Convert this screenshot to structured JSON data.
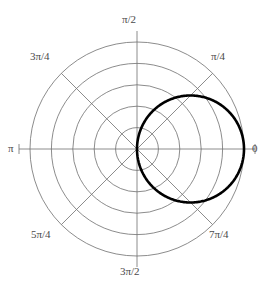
{
  "figure": {
    "kind": "polar-plot",
    "background_color": "#ffffff",
    "grid_color": "#6e6e6e",
    "curve_color": "#000000",
    "label_color": "#4a4a4a"
  },
  "axis_labels": {
    "theta_0": "0",
    "theta_45": "π/4",
    "theta_90": "π/2",
    "theta_135": "3π/4",
    "theta_180": "π",
    "theta_225": "5π/4",
    "theta_270": "3π/2",
    "theta_315": "7π/4"
  },
  "chart_data": {
    "type": "line",
    "projection": "polar",
    "title": "",
    "xlabel": "",
    "ylabel": "",
    "grid": true,
    "legend": null,
    "theta_unit": "radians",
    "theta_tick_labels": [
      "0",
      "π/4",
      "π/2",
      "3π/4",
      "π",
      "5π/4",
      "3π/2",
      "7π/4"
    ],
    "theta_tick_values": [
      0,
      0.7853981634,
      1.5707963268,
      2.3561944902,
      3.1415926536,
      3.926990817,
      4.7123889804,
      5.4977871438
    ],
    "theta_direction": "counterclockwise",
    "theta_zero_location": "E",
    "r_rings": 5,
    "rlim": [
      0,
      5
    ],
    "r_tick_values": [
      1,
      2,
      3,
      4,
      5
    ],
    "r_tick_labels_visible": false,
    "series": [
      {
        "name": "r = 5 cos(θ)",
        "equation": "r = 5*cos(theta)",
        "description": "Limacon-type closed curve passing through the origin, symmetric about the horizontal axis, maximum radius 5 at theta = 0.",
        "closed": true,
        "line_width": 2.6,
        "color": "#000000",
        "points": [
          {
            "theta": 0.0,
            "r": 5.0
          },
          {
            "theta": 0.1309,
            "r": 4.957
          },
          {
            "theta": 0.2618,
            "r": 4.83
          },
          {
            "theta": 0.3927,
            "r": 4.619
          },
          {
            "theta": 0.5236,
            "r": 4.33
          },
          {
            "theta": 0.6545,
            "r": 3.967
          },
          {
            "theta": 0.7854,
            "r": 3.536
          },
          {
            "theta": 0.9163,
            "r": 3.045
          },
          {
            "theta": 1.0472,
            "r": 2.5
          },
          {
            "theta": 1.1781,
            "r": 1.913
          },
          {
            "theta": 1.309,
            "r": 1.294
          },
          {
            "theta": 1.4399,
            "r": 0.653
          },
          {
            "theta": 1.5708,
            "r": 0.0
          },
          {
            "theta": 1.7017,
            "r": -0.653
          },
          {
            "theta": 1.8326,
            "r": -1.294
          },
          {
            "theta": 1.9635,
            "r": -1.913
          },
          {
            "theta": 2.0944,
            "r": -2.5
          },
          {
            "theta": 2.2253,
            "r": -3.045
          },
          {
            "theta": 2.3562,
            "r": -3.536
          },
          {
            "theta": 2.4871,
            "r": -3.967
          },
          {
            "theta": 2.618,
            "r": -4.33
          },
          {
            "theta": 2.7489,
            "r": -4.619
          },
          {
            "theta": 2.8798,
            "r": -4.83
          },
          {
            "theta": 3.0107,
            "r": -4.957
          },
          {
            "theta": 3.1416,
            "r": -5.0
          }
        ]
      }
    ],
    "annotations": []
  }
}
